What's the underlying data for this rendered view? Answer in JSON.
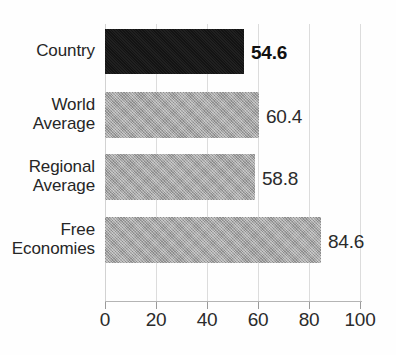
{
  "chart_data": {
    "type": "bar",
    "orientation": "horizontal",
    "title": "",
    "title_note": "chart title is cropped off the top edge of the screenshot and is not legible",
    "xlabel": "",
    "ylabel": "",
    "categories": [
      "Country",
      "World Average",
      "Regional Average",
      "Free Economies"
    ],
    "values": [
      54.6,
      58.8,
      60.4,
      84.6
    ],
    "series": [
      {
        "name": "Score",
        "points": [
          {
            "category": "Country",
            "value": 54.6,
            "label": "54.6",
            "emphasis": true,
            "color": "#161616"
          },
          {
            "category": "World Average",
            "value": 60.4,
            "label": "60.4",
            "emphasis": false,
            "color": "#a6a6a6"
          },
          {
            "category": "Regional Average",
            "value": 58.8,
            "label": "58.8",
            "emphasis": false,
            "color": "#a6a6a6"
          },
          {
            "category": "Free Economies",
            "value": 84.6,
            "label": "84.6",
            "emphasis": false,
            "color": "#a6a6a6"
          }
        ]
      }
    ],
    "bars": [
      {
        "label_lines": [
          "Country"
        ],
        "value": 54.6,
        "value_label": "54.6",
        "emphasis": true
      },
      {
        "label_lines": [
          "World",
          "Average"
        ],
        "value": 60.4,
        "value_label": "60.4",
        "emphasis": false
      },
      {
        "label_lines": [
          "Regional",
          "Average"
        ],
        "value": 58.8,
        "value_label": "58.8",
        "emphasis": false
      },
      {
        "label_lines": [
          "Free",
          "Economies"
        ],
        "value": 84.6,
        "value_label": "84.6",
        "emphasis": false
      }
    ],
    "xlim": [
      0,
      100
    ],
    "xticks": [
      0,
      20,
      40,
      60,
      80,
      100
    ],
    "xtick_labels": [
      "0",
      "20",
      "40",
      "60",
      "80",
      "100"
    ],
    "grid": true,
    "grid_axis": "x",
    "legend": false,
    "colors": {
      "bar_highlight": "#161616",
      "bar_default": "#a6a6a6",
      "gridline": "#dcdcdc",
      "axis": "#b4b4b4",
      "text": "#2b2b2b",
      "background": "#ffffff"
    }
  }
}
